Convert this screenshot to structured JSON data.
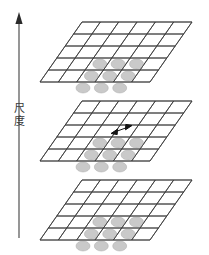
{
  "figure": {
    "title": "",
    "background_color": "#ffffff",
    "axis": {
      "name": "scale-axis",
      "label_text": "尺度",
      "label_chars": [
        "尺",
        "度"
      ],
      "direction": "up",
      "arrow_head": "solid-triangle",
      "color": "#555555",
      "x": 19,
      "y_top": 14,
      "y_bottom": 238
    },
    "planes": [
      {
        "id": "plane-top",
        "label": "top-plane",
        "cols": 6,
        "rows": 5,
        "line_color": "#3c3c3c",
        "fill_color": "#ffffff",
        "origin_x": 40,
        "origin_y": 82,
        "width": 110,
        "height": 60,
        "skew_x": 42,
        "dots": {
          "count": 9,
          "grid": "3x3",
          "color": "#c9c9c9",
          "edge_color": "#a8a8a8",
          "rx": 7,
          "ry": 5
        },
        "annotation": null
      },
      {
        "id": "plane-middle",
        "label": "middle-plane",
        "cols": 6,
        "rows": 5,
        "line_color": "#3c3c3c",
        "fill_color": "#ffffff",
        "origin_x": 40,
        "origin_y": 161,
        "width": 110,
        "height": 60,
        "skew_x": 42,
        "dots": {
          "count": 9,
          "grid": "3x3",
          "color": "#c9c9c9",
          "edge_color": "#a8a8a8",
          "rx": 7,
          "ry": 5
        },
        "annotation": {
          "name": "spacing-double-arrow",
          "type": "double-headed-arrow",
          "color": "#1a1a1a",
          "x1": 112,
          "y1": 132,
          "x2": 131,
          "y2": 126
        }
      },
      {
        "id": "plane-bottom",
        "label": "bottom-plane",
        "cols": 6,
        "rows": 5,
        "line_color": "#3c3c3c",
        "fill_color": "#ffffff",
        "origin_x": 40,
        "origin_y": 240,
        "width": 110,
        "height": 60,
        "skew_x": 42,
        "dots": {
          "count": 9,
          "grid": "3x3",
          "color": "#c9c9c9",
          "edge_color": "#a8a8a8",
          "rx": 7,
          "ry": 5
        },
        "annotation": null
      }
    ]
  }
}
